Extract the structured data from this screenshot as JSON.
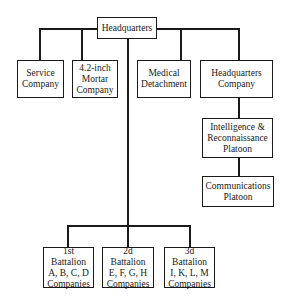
{
  "chart": {
    "root": {
      "label": "Headquarters"
    },
    "top_units": [
      {
        "id": "service",
        "label": "Service\nCompany"
      },
      {
        "id": "mortar",
        "label": "4.2-inch\nMortar\nCompany"
      },
      {
        "id": "medical",
        "label": "Medical\nDetachment"
      },
      {
        "id": "hq_company",
        "label": "Headquarters\nCompany"
      }
    ],
    "hq_company_children": [
      {
        "id": "ir_platoon",
        "label": "Intelligence &\nReconnaissance\nPlatoon"
      },
      {
        "id": "comms_platoon",
        "label": "Communications\nPlatoon"
      }
    ],
    "battalions": [
      {
        "id": "bn1",
        "label": "1st Battalion\nA, B, C, D\nCompanies"
      },
      {
        "id": "bn2",
        "label": "2d Battalion\nE, F, G, H\nCompanies"
      },
      {
        "id": "bn3",
        "label": "3d Battalion\nI, K, L, M\nCompanies"
      }
    ]
  }
}
